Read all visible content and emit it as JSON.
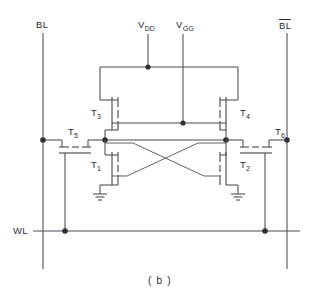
{
  "figure": {
    "caption": "( b )"
  },
  "labels": {
    "bitline_left": "BL",
    "bitline_right_base": "BL",
    "bitline_right_overbar": true,
    "wordline": "WL",
    "supply_vdd_base": "V",
    "supply_vdd_sub": "DD",
    "supply_vgg_base": "V",
    "supply_vgg_sub": "GG",
    "t1_base": "T",
    "t1_sub": "1",
    "t2_base": "T",
    "t2_sub": "2",
    "t3_base": "T",
    "t3_sub": "3",
    "t4_base": "T",
    "t4_sub": "4",
    "t5_base": "T",
    "t5_sub": "5",
    "t6_base": "T",
    "t6_sub": "6"
  },
  "colors": {
    "wire": "#4a4a52",
    "node": "#2f2f35",
    "text": "#2b2b31",
    "background": "#ffffff"
  },
  "nodes": {
    "bitline_left_x": 43,
    "bitline_right_x": 287,
    "vdd_x": 148,
    "vgg_x": 183,
    "vdd_rail_y": 67,
    "vgg_rail_y": 123,
    "storage_rail_y": 140,
    "wordline_y": 231,
    "left_storage_x": 105,
    "right_storage_x": 226
  }
}
